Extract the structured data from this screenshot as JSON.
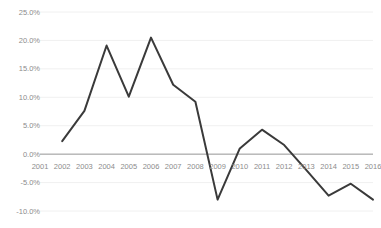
{
  "chart_data": {
    "type": "line",
    "title": "",
    "title_note": "chart title is clipped off the top edge of the screenshot and is not legible",
    "xlabel": "",
    "ylabel": "",
    "categories": [
      "2001",
      "2002",
      "2003",
      "2004",
      "2005",
      "2006",
      "2007",
      "2008",
      "2009",
      "2010",
      "2011",
      "2012",
      "2013",
      "2014",
      "2015",
      "2016"
    ],
    "x": [
      2001,
      2002,
      2003,
      2004,
      2005,
      2006,
      2007,
      2008,
      2009,
      2010,
      2011,
      2012,
      2013,
      2014,
      2015,
      2016
    ],
    "values": [
      null,
      2.3,
      7.6,
      19.1,
      10.1,
      20.5,
      12.2,
      9.2,
      -8.0,
      1.0,
      4.3,
      1.6,
      -2.8,
      -7.3,
      -5.2,
      -8.0
    ],
    "series": [
      {
        "name": "",
        "values": [
          null,
          2.3,
          7.6,
          19.1,
          10.1,
          20.5,
          12.2,
          9.2,
          -8.0,
          1.0,
          4.3,
          1.6,
          -2.8,
          -7.3,
          -5.2,
          -8.0
        ]
      }
    ],
    "ylim": [
      -10.0,
      25.0
    ],
    "yticks": [
      25.0,
      20.0,
      15.0,
      10.0,
      5.0,
      0.0,
      -5.0,
      -10.0
    ],
    "ytick_labels": [
      "25.0%",
      "20.0%",
      "15.0%",
      "10.0%",
      "5.0%",
      "0.0%",
      "-5.0%",
      "-10.0%"
    ],
    "xtick_labels": [
      "2001",
      "2002",
      "2003",
      "2004",
      "2005",
      "2006",
      "2007",
      "2008",
      "2009",
      "2010",
      "2011",
      "2012",
      "2013",
      "2014",
      "2015",
      "2016"
    ],
    "grid": true,
    "legend": false,
    "legend_position": "none",
    "units": "percent",
    "annotations": []
  },
  "style": {
    "line_color": "#3a3a3a",
    "grid_color": "#f0f0f0",
    "zero_line_color": "#9a9a9a",
    "tick_label_color": "#8c8c8c",
    "background": "#ffffff"
  },
  "axis": {
    "y_labels": [
      "25.0%",
      "20.0%",
      "15.0%",
      "10.0%",
      "5.0%",
      "0.0%",
      "-5.0%",
      "-10.0%"
    ],
    "x_labels": [
      "2001",
      "2002",
      "2003",
      "2004",
      "2005",
      "2006",
      "2007",
      "2008",
      "2009",
      "2010",
      "2011",
      "2012",
      "2013",
      "2014",
      "2015",
      "2016"
    ]
  }
}
